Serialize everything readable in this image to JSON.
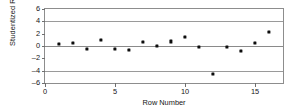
{
  "chart_data": {
    "type": "scatter",
    "title": "",
    "xlabel": "Row Number",
    "ylabel": "Studentized Residual",
    "xlim": [
      0,
      17
    ],
    "ylim": [
      -6,
      6
    ],
    "xticks": [
      0,
      5,
      10,
      15
    ],
    "yticks": [
      6,
      4,
      2,
      0,
      -2,
      -4,
      -6
    ],
    "ytick_labels": [
      "6",
      "4",
      "2",
      "0",
      "–2",
      "–4",
      "–6"
    ],
    "xtick_labels": [
      "0",
      "5",
      "10",
      "15"
    ],
    "grid": false,
    "legend": "none",
    "reference_lines": [
      {
        "y": 4,
        "style": "solid"
      },
      {
        "y": 0,
        "style": "solid"
      },
      {
        "y": -4,
        "style": "solid"
      }
    ],
    "x": [
      1,
      2,
      3,
      4,
      5,
      6,
      7,
      8,
      9,
      10,
      11,
      12,
      13,
      14,
      15,
      16
    ],
    "values": [
      0.35,
      0.45,
      -0.5,
      1.0,
      -0.5,
      -0.6,
      0.7,
      0.05,
      0.75,
      1.45,
      -0.15,
      -4.5,
      -0.15,
      -0.75,
      0.5,
      2.3
    ],
    "marker": "square",
    "marker_color": "#0d0d0d"
  }
}
